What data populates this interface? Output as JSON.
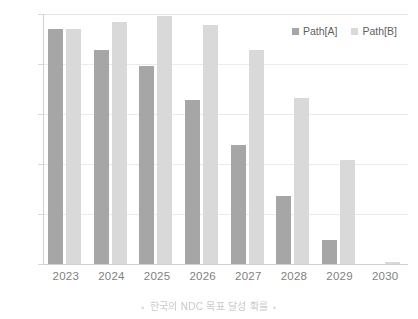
{
  "chart_data": {
    "type": "bar",
    "title": "",
    "xlabel": "",
    "ylabel": "",
    "ylim": [
      0.0,
      0.5
    ],
    "ytick_labels": [
      "0.5",
      "0.4",
      "0.3",
      "0.2",
      "0.1",
      "0.0"
    ],
    "ytick_values": [
      0.5,
      0.4,
      0.3,
      0.2,
      0.1,
      0.0
    ],
    "grid": true,
    "legend_position": "top-right",
    "categories": [
      "2023",
      "2024",
      "2025",
      "2026",
      "2027",
      "2028",
      "2029",
      "2030"
    ],
    "series": [
      {
        "name": "Path[A]",
        "color": "#a6a6a6",
        "values": [
          0.47,
          0.428,
          0.396,
          0.329,
          0.239,
          0.136,
          0.049,
          0.0
        ]
      },
      {
        "name": "Path[B]",
        "color": "#d9d9d9",
        "values": [
          0.47,
          0.485,
          0.497,
          0.479,
          0.428,
          0.333,
          0.209,
          0.005
        ]
      }
    ]
  },
  "legend": {
    "items": [
      {
        "label": "Path[A]",
        "color": "#a6a6a6"
      },
      {
        "label": "Path[B]",
        "color": "#d9d9d9"
      }
    ]
  },
  "caption": {
    "bullet_left": "▪",
    "text": "한국의 NDC 목표 달성 확률",
    "bullet_right": "▪"
  },
  "colors": {
    "series_a": "#a6a6a6",
    "series_b": "#d9d9d9",
    "gridline": "#eceaea",
    "axis": "#d0d0d0",
    "tick_text": "#7f7f7f",
    "background": "#ffffff"
  }
}
